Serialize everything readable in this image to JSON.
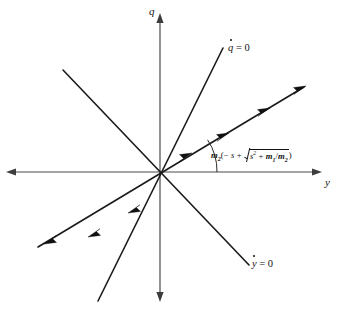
{
  "figure": {
    "type": "phase-plane-diagram",
    "background_color": "#ffffff",
    "axes": {
      "vertical_label": "q",
      "horizontal_label": "y",
      "origin": [
        160,
        172
      ],
      "vertical_extent": [
        14,
        300
      ],
      "horizontal_extent": [
        6,
        322
      ],
      "color": "#4a4a4a"
    },
    "nullclines": [
      {
        "name": "qdot-nullcline",
        "label_variable": "q",
        "label_equals": " = 0",
        "label_position": [
          228,
          42
        ],
        "slope_description": "steep positive line through origin",
        "endpoints": [
          [
            223,
            48
          ],
          [
            98,
            301
          ]
        ],
        "color": "#1a1a1a"
      },
      {
        "name": "ydot-nullcline",
        "label_variable": "y",
        "label_equals": " = 0",
        "label_position": [
          252,
          258
        ],
        "slope_description": "negative-slope line through origin",
        "endpoints": [
          [
            63,
            70
          ],
          [
            249,
            265
          ]
        ],
        "color": "#1a1a1a"
      }
    ],
    "trajectory": {
      "name": "saddle-path",
      "description": "shallow positive-slope line through origin with outward-pointing arrowheads",
      "endpoints": [
        [
          38,
          247
        ],
        [
          306,
          86
        ]
      ],
      "arrow_count": 6,
      "arrow_direction": "away from origin",
      "color": "#1a1a1a"
    },
    "angle_annotation": {
      "name": "slope-angle-arc",
      "vertex": [
        160,
        172
      ],
      "from": "positive y-axis",
      "to": "trajectory line",
      "formula_position": [
        211,
        148
      ],
      "formula_plain": "m2(-s + sqrt(s^2 + m1/m2))",
      "formula_parts": {
        "coefficient": "m",
        "coefficient_sub": "2",
        "open_paren": "(",
        "minus": "− ",
        "s_var": "s",
        "plus": " + ",
        "radicand_base": "s",
        "radicand_exp": "2",
        "radicand_plus": " + ",
        "num_var": "m",
        "num_sub": "1",
        "slash": "/",
        "den_var": "m",
        "den_sub": "2",
        "close_paren": ")"
      }
    }
  }
}
